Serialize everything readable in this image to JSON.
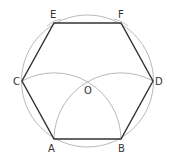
{
  "diagram": {
    "type": "geometric-construction",
    "colors": {
      "background": "#ffffff",
      "hexagon_stroke": "#333333",
      "construction_stroke": "#b0b0b0",
      "label": "#333333"
    },
    "circle": {
      "center": [
        87.5,
        81
      ],
      "radius": 66
    },
    "center_point": {
      "label": "O",
      "pos": [
        87.5,
        81
      ],
      "label_pos": [
        84,
        93
      ]
    },
    "vertices": [
      {
        "label": "A",
        "pos": [
          54,
          139
        ],
        "label_pos": [
          48,
          152
        ]
      },
      {
        "label": "B",
        "pos": [
          121,
          139
        ],
        "label_pos": [
          118,
          152
        ]
      },
      {
        "label": "D",
        "pos": [
          153,
          81
        ],
        "label_pos": [
          155,
          85
        ]
      },
      {
        "label": "F",
        "pos": [
          121,
          23
        ],
        "label_pos": [
          118,
          18
        ]
      },
      {
        "label": "E",
        "pos": [
          54,
          23
        ],
        "label_pos": [
          50,
          18
        ]
      },
      {
        "label": "C",
        "pos": [
          22,
          81
        ],
        "label_pos": [
          14,
          85
        ]
      }
    ],
    "construction_arcs": [
      {
        "center": "A",
        "through": [
          "B",
          "O",
          "C"
        ]
      },
      {
        "center": "B",
        "through": [
          "A",
          "O",
          "D"
        ]
      }
    ]
  }
}
